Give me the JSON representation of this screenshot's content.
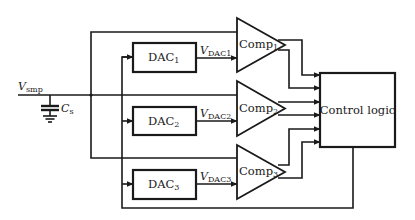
{
  "diagram": {
    "title": "",
    "input": {
      "symbol": "V",
      "subscript": "smp"
    },
    "capacitor": {
      "symbol": "C",
      "subscript": "s"
    },
    "dacs": [
      {
        "name": "DAC",
        "index": "1",
        "output_symbol": "V",
        "output_subscript": "DAC1"
      },
      {
        "name": "DAC",
        "index": "2",
        "output_symbol": "V",
        "output_subscript": "DAC2"
      },
      {
        "name": "DAC",
        "index": "3",
        "output_symbol": "V",
        "output_subscript": "DAC3"
      }
    ],
    "comparators": [
      {
        "name": "Comp",
        "index": "1"
      },
      {
        "name": "Comp",
        "index": "2"
      },
      {
        "name": "Comp",
        "index": "3"
      }
    ],
    "control_block": {
      "label": "Control logic"
    },
    "colors": {
      "stroke": "#1a1a1a",
      "background": "#ffffff"
    }
  }
}
